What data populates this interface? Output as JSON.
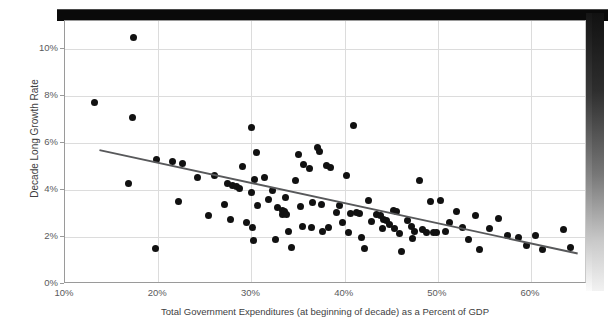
{
  "chart_data": {
    "type": "scatter",
    "title": "",
    "xlabel": "Total Government Expenditures (at beginning of decade) as a Percent of GDP",
    "ylabel": "Decade Long Growth Rate",
    "xlim": [
      10,
      66
    ],
    "ylim": [
      0,
      11.2
    ],
    "x_ticks": [
      "10%",
      "20%",
      "30%",
      "40%",
      "50%",
      "60%"
    ],
    "x_tick_values": [
      10,
      20,
      30,
      40,
      50,
      60
    ],
    "y_ticks": [
      "0%",
      "2%",
      "4%",
      "6%",
      "8%",
      "10%"
    ],
    "y_tick_values": [
      0,
      2,
      4,
      6,
      8,
      10
    ],
    "grid": true,
    "legend": "none",
    "marker_color": "#111111",
    "trendline_color": "#58595b",
    "trendline": {
      "x_start": 13.7,
      "y_start": 5.7,
      "x_end": 65.0,
      "y_end": 1.3
    },
    "points": [
      {
        "x": 13.2,
        "y": 7.75
      },
      {
        "x": 17.4,
        "y": 10.5
      },
      {
        "x": 17.2,
        "y": 7.1
      },
      {
        "x": 16.8,
        "y": 4.3
      },
      {
        "x": 19.8,
        "y": 5.3
      },
      {
        "x": 21.5,
        "y": 5.2
      },
      {
        "x": 22.6,
        "y": 5.15
      },
      {
        "x": 19.7,
        "y": 1.5
      },
      {
        "x": 22.2,
        "y": 3.5
      },
      {
        "x": 25.4,
        "y": 2.9
      },
      {
        "x": 24.2,
        "y": 4.55
      },
      {
        "x": 26.0,
        "y": 4.6
      },
      {
        "x": 27.4,
        "y": 4.3
      },
      {
        "x": 28.0,
        "y": 4.2
      },
      {
        "x": 28.4,
        "y": 4.15
      },
      {
        "x": 28.7,
        "y": 4.05
      },
      {
        "x": 27.1,
        "y": 3.4
      },
      {
        "x": 27.8,
        "y": 2.75
      },
      {
        "x": 29.0,
        "y": 5.0
      },
      {
        "x": 30.0,
        "y": 6.65
      },
      {
        "x": 30.3,
        "y": 4.45
      },
      {
        "x": 30.5,
        "y": 5.6
      },
      {
        "x": 30.0,
        "y": 3.9
      },
      {
        "x": 30.6,
        "y": 3.35
      },
      {
        "x": 30.1,
        "y": 2.4
      },
      {
        "x": 30.2,
        "y": 1.85
      },
      {
        "x": 29.5,
        "y": 2.6
      },
      {
        "x": 31.4,
        "y": 4.55
      },
      {
        "x": 31.8,
        "y": 3.6
      },
      {
        "x": 32.3,
        "y": 4.0
      },
      {
        "x": 32.8,
        "y": 3.25
      },
      {
        "x": 33.3,
        "y": 3.15
      },
      {
        "x": 33.3,
        "y": 2.95
      },
      {
        "x": 33.5,
        "y": 3.1
      },
      {
        "x": 33.8,
        "y": 2.95
      },
      {
        "x": 33.7,
        "y": 3.7
      },
      {
        "x": 34.0,
        "y": 2.25
      },
      {
        "x": 34.3,
        "y": 1.55
      },
      {
        "x": 32.6,
        "y": 1.9
      },
      {
        "x": 34.7,
        "y": 4.4
      },
      {
        "x": 35.0,
        "y": 5.5
      },
      {
        "x": 35.6,
        "y": 5.1
      },
      {
        "x": 35.3,
        "y": 3.3
      },
      {
        "x": 35.5,
        "y": 2.45
      },
      {
        "x": 36.2,
        "y": 4.9
      },
      {
        "x": 36.6,
        "y": 3.45
      },
      {
        "x": 36.4,
        "y": 2.4
      },
      {
        "x": 37.1,
        "y": 5.8
      },
      {
        "x": 37.3,
        "y": 5.65
      },
      {
        "x": 37.5,
        "y": 3.4
      },
      {
        "x": 37.6,
        "y": 2.25
      },
      {
        "x": 38.0,
        "y": 5.05
      },
      {
        "x": 38.5,
        "y": 4.95
      },
      {
        "x": 38.3,
        "y": 2.4
      },
      {
        "x": 39.1,
        "y": 3.05
      },
      {
        "x": 39.5,
        "y": 3.35
      },
      {
        "x": 39.8,
        "y": 2.6
      },
      {
        "x": 40.2,
        "y": 4.6
      },
      {
        "x": 40.6,
        "y": 3.0
      },
      {
        "x": 40.4,
        "y": 2.2
      },
      {
        "x": 41.0,
        "y": 6.75
      },
      {
        "x": 41.3,
        "y": 3.05
      },
      {
        "x": 41.6,
        "y": 3.0
      },
      {
        "x": 41.8,
        "y": 2.0
      },
      {
        "x": 42.1,
        "y": 1.5
      },
      {
        "x": 42.6,
        "y": 3.55
      },
      {
        "x": 42.9,
        "y": 2.65
      },
      {
        "x": 43.4,
        "y": 2.95
      },
      {
        "x": 43.8,
        "y": 2.9
      },
      {
        "x": 44.2,
        "y": 2.75
      },
      {
        "x": 44.5,
        "y": 2.7
      },
      {
        "x": 44.1,
        "y": 2.35
      },
      {
        "x": 44.8,
        "y": 2.55
      },
      {
        "x": 45.2,
        "y": 3.15
      },
      {
        "x": 45.6,
        "y": 3.1
      },
      {
        "x": 45.3,
        "y": 2.35
      },
      {
        "x": 45.9,
        "y": 2.15
      },
      {
        "x": 46.1,
        "y": 1.4
      },
      {
        "x": 46.7,
        "y": 2.7
      },
      {
        "x": 47.2,
        "y": 2.45
      },
      {
        "x": 47.5,
        "y": 2.25
      },
      {
        "x": 47.3,
        "y": 1.95
      },
      {
        "x": 48.0,
        "y": 4.4
      },
      {
        "x": 48.3,
        "y": 2.3
      },
      {
        "x": 48.8,
        "y": 2.2
      },
      {
        "x": 49.2,
        "y": 3.5
      },
      {
        "x": 49.5,
        "y": 2.2
      },
      {
        "x": 49.9,
        "y": 2.2
      },
      {
        "x": 50.3,
        "y": 3.55
      },
      {
        "x": 50.8,
        "y": 2.25
      },
      {
        "x": 51.2,
        "y": 2.6
      },
      {
        "x": 52.0,
        "y": 3.1
      },
      {
        "x": 52.6,
        "y": 2.4
      },
      {
        "x": 53.3,
        "y": 1.9
      },
      {
        "x": 54.0,
        "y": 2.9
      },
      {
        "x": 54.5,
        "y": 1.45
      },
      {
        "x": 55.5,
        "y": 2.35
      },
      {
        "x": 56.5,
        "y": 2.8
      },
      {
        "x": 57.5,
        "y": 2.05
      },
      {
        "x": 58.6,
        "y": 2.0
      },
      {
        "x": 59.5,
        "y": 1.65
      },
      {
        "x": 60.5,
        "y": 2.05
      },
      {
        "x": 61.2,
        "y": 1.45
      },
      {
        "x": 63.5,
        "y": 2.3
      },
      {
        "x": 64.2,
        "y": 1.55
      }
    ]
  }
}
